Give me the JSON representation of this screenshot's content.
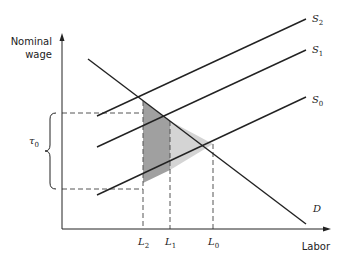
{
  "diagram": {
    "y_axis_label_line1": "Nominal",
    "y_axis_label_line2": "wage",
    "x_axis_label": "Labor",
    "curves": [
      {
        "id": "S2",
        "base": "S",
        "sub": "2",
        "type": "supply"
      },
      {
        "id": "S1",
        "base": "S",
        "sub": "1",
        "type": "supply"
      },
      {
        "id": "S0",
        "base": "S",
        "sub": "0",
        "type": "supply"
      },
      {
        "id": "D",
        "base": "D",
        "sub": "",
        "type": "demand"
      }
    ],
    "x_ticks": [
      {
        "base": "L",
        "sub": "2"
      },
      {
        "base": "L",
        "sub": "1"
      },
      {
        "base": "L",
        "sub": "0"
      }
    ],
    "brace_label": {
      "base": "τ",
      "sub": "0"
    },
    "colors": {
      "line": "#222222",
      "dark_shade": "#a0a0a0",
      "light_shade": "#d4d4d4",
      "dash": "#555555"
    }
  }
}
